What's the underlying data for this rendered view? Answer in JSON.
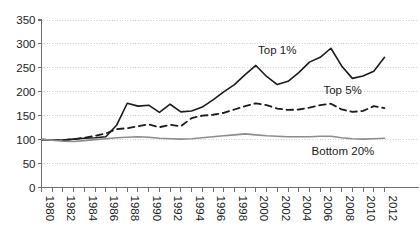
{
  "chart_data": {
    "type": "line",
    "title": "",
    "subtitle": "",
    "xlabel": "",
    "ylabel": "",
    "grid": true,
    "legend_position": "inline-annotations",
    "xlim": [
      1980,
      2012
    ],
    "ylim": [
      0,
      350
    ],
    "yticks": [
      0,
      50,
      100,
      150,
      200,
      250,
      300,
      350
    ],
    "ytick_labels": [
      "0",
      "50",
      "100",
      "150",
      "200",
      "250",
      "300",
      "350"
    ],
    "xticks": [
      1980,
      1982,
      1984,
      1986,
      1988,
      1990,
      1992,
      1994,
      1996,
      1998,
      2000,
      2002,
      2004,
      2006,
      2008,
      2010,
      2012
    ],
    "xtick_labels": [
      "1980",
      "1982",
      "1984",
      "1986",
      "1988",
      "1990",
      "1992",
      "1994",
      "1996",
      "1998",
      "2000",
      "2002",
      "2004",
      "2006",
      "2008",
      "2010",
      "2012"
    ],
    "x": [
      1980,
      1981,
      1982,
      1983,
      1984,
      1985,
      1986,
      1987,
      1988,
      1989,
      1990,
      1991,
      1992,
      1993,
      1994,
      1995,
      1996,
      1997,
      1998,
      1999,
      2000,
      2001,
      2002,
      2003,
      2004,
      2005,
      2006,
      2007,
      2008,
      2009,
      2010,
      2011,
      2012
    ],
    "series": [
      {
        "name": "Top 1%",
        "label": "Top 1%",
        "color": "#1b1b1b",
        "style": "solid",
        "width": 1.6,
        "values": [
          100,
          99,
          99,
          101,
          103,
          104,
          106,
          130,
          176,
          170,
          172,
          157,
          174,
          158,
          160,
          168,
          183,
          200,
          215,
          236,
          255,
          232,
          215,
          222,
          240,
          262,
          272,
          291,
          254,
          228,
          233,
          243,
          272
        ]
      },
      {
        "name": "Top 5%",
        "label": "Top 5%",
        "color": "#1b1b1b",
        "style": "dashed",
        "width": 1.8,
        "values": [
          100,
          99,
          99,
          101,
          104,
          108,
          113,
          122,
          124,
          128,
          132,
          126,
          131,
          128,
          145,
          150,
          152,
          156,
          163,
          170,
          176,
          172,
          165,
          162,
          163,
          167,
          172,
          175,
          163,
          158,
          160,
          170,
          166
        ]
      },
      {
        "name": "Bottom 20%",
        "label": "Bottom 20%",
        "color": "#8c8c8c",
        "style": "solid",
        "width": 1.6,
        "values": [
          100,
          99,
          97,
          96,
          98,
          100,
          102,
          104,
          105,
          106,
          105,
          103,
          102,
          101,
          102,
          104,
          106,
          108,
          110,
          112,
          110,
          108,
          107,
          106,
          106,
          106,
          107,
          107,
          104,
          102,
          101,
          102,
          103
        ]
      }
    ],
    "annotations": [
      {
        "text": "Top 1%",
        "x": 2000.2,
        "y": 278,
        "series": "Top 1%"
      },
      {
        "text": "Top 5%",
        "x": 2006.3,
        "y": 196,
        "series": "Top 5%"
      },
      {
        "text": "Bottom 20%",
        "x": 2005.2,
        "y": 68,
        "series": "Bottom 20%"
      }
    ],
    "axis_color": "#6e6e6e",
    "grid_color": "#c9c9c9",
    "background": "#ffffff"
  }
}
